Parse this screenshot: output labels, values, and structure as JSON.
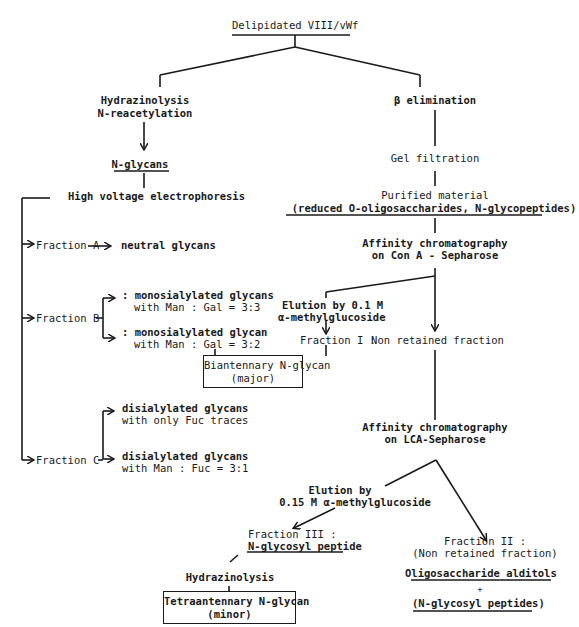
{
  "diagram": {
    "root": "Delipidated VIII/vWf",
    "left_branch": {
      "step1_line1": "Hydrazinolysis",
      "step1_line2": "N-reacetylation",
      "product": "N-glycans",
      "step2": "High voltage electrophoresis",
      "fraction_a": {
        "label": "Fraction A",
        "result": "neutral glycans"
      },
      "fraction_b": {
        "label": "Fraction B",
        "result1_line1": ": monosialylated glycans",
        "result1_line2": "with Man : Gal = 3:3",
        "result2_line1": ": monosialylated glycan",
        "result2_line2": "with Man : Gal = 3:2"
      },
      "fraction_c": {
        "label": "Fraction C",
        "result1_line1": "disialylated glycans",
        "result1_line2": "with only Fuc traces",
        "result2_line1": "disialylated glycans",
        "result2_line2": "with Man : Fuc = 3:1"
      }
    },
    "right_branch": {
      "step1": "β elimination",
      "step2": "Gel filtration",
      "purified_line1": "Purified material",
      "purified_line2": "(reduced O-oligosaccharides, N-glycopeptides)",
      "con_a_line1": "Affinity chromatography",
      "con_a_line2": "on Con A - Sepharose",
      "elution1_line1": "Elution by 0.1 M",
      "elution1_line2": "α-methylglucoside",
      "fraction_1": "Fraction I :",
      "non_retained": "Non retained fraction",
      "biantennary_line1": "Biantennary N-glycan",
      "biantennary_line2": "(major)",
      "lca_line1": "Affinity chromatography",
      "lca_line2": "on LCA-Sepharose",
      "elution2_line1": "Elution by",
      "elution2_line2": "0.15 M α-methylglucoside",
      "fraction_3_line1": "Fraction III :",
      "fraction_3_line2": "N-glycosyl peptide",
      "fraction_2_line1": "Fraction II :",
      "fraction_2_line2": "(Non retained fraction)",
      "hydrazinolysis2": "Hydrazinolysis",
      "tetraantennary_line1": "Tetraantennary N-glycan",
      "tetraantennary_line2": "(minor)",
      "alditols": "Oligosaccharide alditols",
      "plus": "+",
      "glycosyl_peptides": "(N-glycosyl peptides)"
    }
  }
}
